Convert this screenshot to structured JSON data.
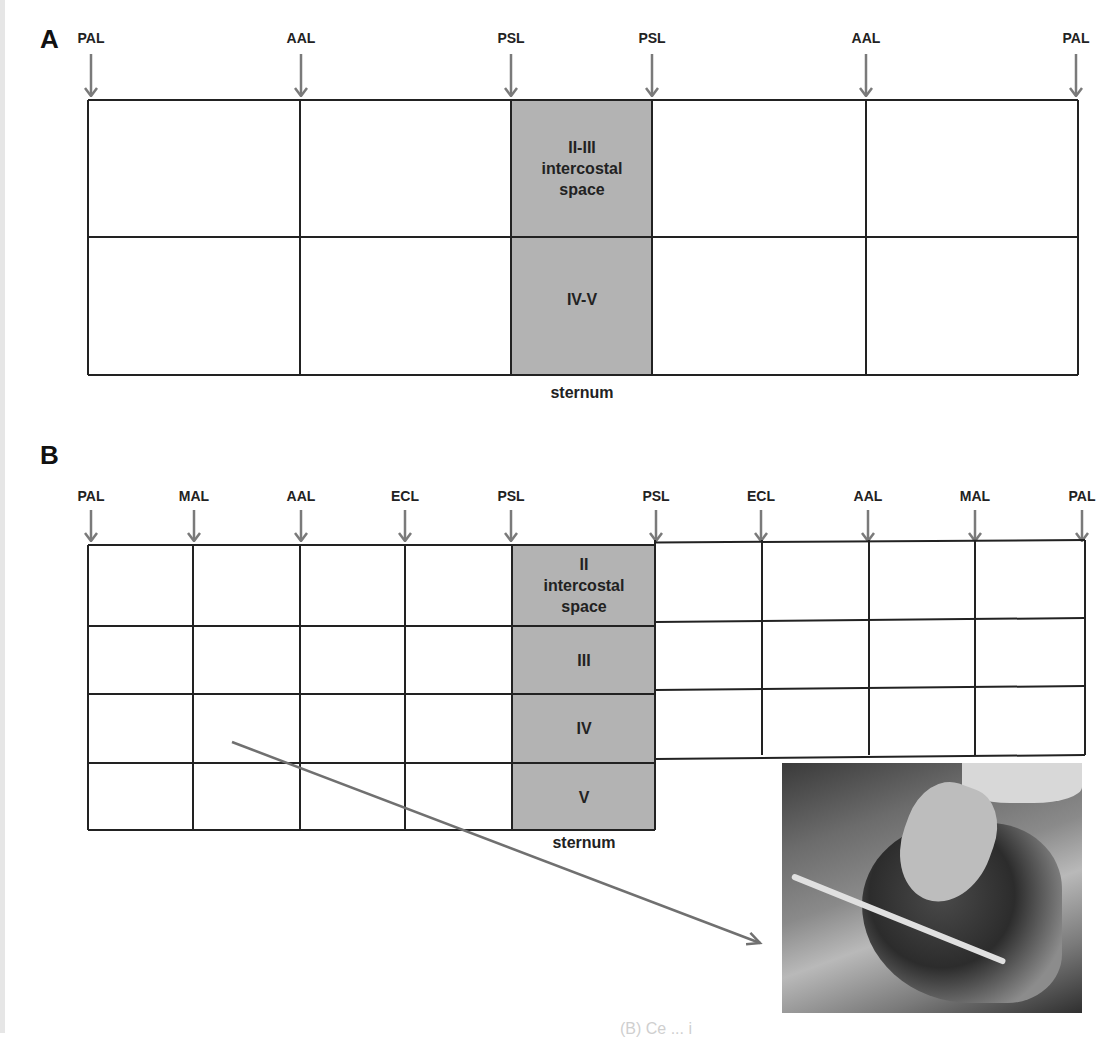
{
  "panel_a": {
    "letter": "A",
    "line_labels": [
      {
        "text": "PAL",
        "x": 91
      },
      {
        "text": "AAL",
        "x": 301
      },
      {
        "text": "PSL",
        "x": 511
      },
      {
        "text": "PSL",
        "x": 652
      },
      {
        "text": "AAL",
        "x": 866
      },
      {
        "text": "PAL",
        "x": 1076
      }
    ],
    "grid": {
      "columns_x": [
        88,
        300,
        511,
        652,
        866,
        1078
      ],
      "rows_y": [
        100,
        237,
        375
      ],
      "shaded_column": {
        "from_x": 511,
        "to_x": 652,
        "color": "#b3b3b3"
      }
    },
    "cells": [
      {
        "text_lines": [
          "II-III",
          "intercostal",
          "space"
        ],
        "x": 582,
        "y": 168
      },
      {
        "text_lines": [
          "IV-V"
        ],
        "x": 582,
        "y": 299
      }
    ],
    "bottom_label": "sternum"
  },
  "panel_b": {
    "letter": "B",
    "line_labels": [
      {
        "text": "PAL",
        "x": 91
      },
      {
        "text": "MAL",
        "x": 194
      },
      {
        "text": "AAL",
        "x": 301
      },
      {
        "text": "ECL",
        "x": 405
      },
      {
        "text": "PSL",
        "x": 511
      },
      {
        "text": "PSL",
        "x": 656
      },
      {
        "text": "ECL",
        "x": 761
      },
      {
        "text": "AAL",
        "x": 868
      },
      {
        "text": "MAL",
        "x": 975
      },
      {
        "text": "PAL",
        "x": 1082
      }
    ],
    "grid": {
      "left_columns_x": [
        88,
        193,
        300,
        405,
        512,
        655
      ],
      "right_columns_x": [
        655,
        762,
        869,
        975,
        1085
      ],
      "left_rows_y": [
        545,
        626,
        694,
        763,
        830
      ],
      "right_rows_y": [
        540,
        618,
        686,
        755
      ],
      "shaded_column": {
        "from_x": 512,
        "to_x": 655,
        "color": "#b3b3b3"
      }
    },
    "cells": [
      {
        "text_lines": [
          "II",
          "intercostal",
          "space"
        ],
        "x": 584,
        "y": 585
      },
      {
        "text_lines": [
          "III"
        ],
        "x": 584,
        "y": 660
      },
      {
        "text_lines": [
          "IV"
        ],
        "x": 584,
        "y": 728
      },
      {
        "text_lines": [
          "V"
        ],
        "x": 584,
        "y": 797
      }
    ],
    "bottom_label": "sternum",
    "pointer_arrow": {
      "from": [
        232,
        742
      ],
      "to": [
        760,
        943
      ],
      "color": "#707070"
    }
  },
  "photo": {
    "description": "ultrasound probe placed on patient's chest",
    "x": 782,
    "y": 763,
    "width": 300,
    "height": 250
  },
  "colors": {
    "grid_line": "#222222",
    "arrow": "#7a7a7a",
    "shaded": "#b3b3b3",
    "label_text": "#222222"
  },
  "footer_fragment": "(B) Ce      ... i"
}
